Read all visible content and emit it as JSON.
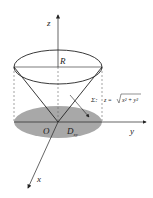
{
  "diagram": {
    "labels": {
      "z_axis": "z",
      "y_axis": "y",
      "x_axis": "x",
      "origin": "O",
      "radius": "R",
      "region": "D",
      "region_sub": "xy",
      "surface_name": "Σ:",
      "surface_eq_lhs": "z =",
      "surface_eq_rhs": "x² + y²"
    },
    "colors": {
      "stroke": "#222222",
      "region_fill": "#a8a8a8",
      "dashed": "#666666",
      "background": "#ffffff"
    }
  }
}
